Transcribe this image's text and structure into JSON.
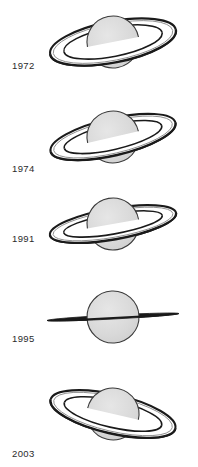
{
  "figure": {
    "background_color": "#ffffff",
    "width": 198,
    "height": 467
  },
  "style": {
    "sphere_fill": "#d9d9d9",
    "sphere_stroke": "#3a3a3a",
    "ring_dark": "#1a1a1a",
    "ring_light": "#f2f2f2",
    "ring_mid": "#8c8c8c",
    "label_color": "#2b2b2b"
  },
  "panels": [
    {
      "year": "1972",
      "label_x": 12,
      "label_y": 60,
      "panel_top": 0,
      "panel_height": 95,
      "center_x": 113,
      "center_y": 42,
      "sphere_radius": 26,
      "ring_outer_rx": 64,
      "ring_outer_ry": 20.5,
      "ring_inner_rx": 50,
      "ring_inner_ry": 14.5,
      "ring_tilt_deg": -11,
      "ring_state": "open",
      "ring_aspect": "wide"
    },
    {
      "year": "1974",
      "label_x": 12,
      "label_y": 163,
      "panel_top": 95,
      "panel_height": 95,
      "center_x": 113,
      "center_y": 137,
      "sphere_radius": 26,
      "ring_outer_rx": 64,
      "ring_outer_ry": 18.5,
      "ring_inner_rx": 50,
      "ring_inner_ry": 12.5,
      "ring_tilt_deg": -13,
      "ring_state": "open",
      "ring_aspect": "wide"
    },
    {
      "year": "1991",
      "label_x": 12,
      "label_y": 233,
      "panel_top": 190,
      "panel_height": 92,
      "center_x": 113,
      "center_y": 224,
      "sphere_radius": 26,
      "ring_outer_rx": 64,
      "ring_outer_ry": 15.5,
      "ring_inner_rx": 50,
      "ring_inner_ry": 10.0,
      "ring_tilt_deg": -10,
      "ring_state": "narrowing",
      "ring_aspect": "medium"
    },
    {
      "year": "1995",
      "label_x": 12,
      "label_y": 333,
      "panel_top": 282,
      "panel_height": 95,
      "center_x": 113,
      "center_y": 317,
      "sphere_radius": 26,
      "ring_outer_rx": 66,
      "ring_outer_ry": 2.0,
      "ring_inner_rx": 52,
      "ring_inner_ry": 0.6,
      "ring_tilt_deg": -3,
      "ring_state": "edge-on",
      "ring_aspect": "edge"
    },
    {
      "year": "2003",
      "label_x": 12,
      "label_y": 448,
      "panel_top": 377,
      "panel_height": 90,
      "center_x": 113,
      "center_y": 414,
      "sphere_radius": 26,
      "ring_outer_rx": 64,
      "ring_outer_ry": 19.5,
      "ring_inner_rx": 50,
      "ring_inner_ry": 13.5,
      "ring_tilt_deg": 13,
      "ring_state": "open",
      "ring_aspect": "wide"
    }
  ],
  "chart_data": {
    "type": "diagram",
    "categories": [
      "1972",
      "1974",
      "1991",
      "1995",
      "2003"
    ],
    "series": [
      {
        "name": "ring opening (apparent ring minor/major axis ratio)",
        "values": [
          0.32,
          0.29,
          0.24,
          0.03,
          0.3
        ]
      },
      {
        "name": "ring tilt angle (degrees, negative = left edge raised)",
        "values": [
          -11,
          -13,
          -10,
          -3,
          13
        ]
      }
    ],
    "xlabel": "Year",
    "ylabel": "Ring opening"
  }
}
